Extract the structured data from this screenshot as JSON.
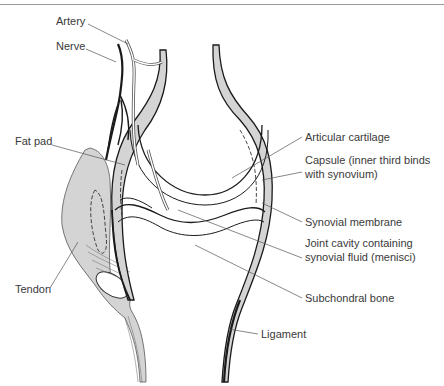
{
  "diagram": {
    "type": "anatomical-illustration",
    "colors": {
      "outline": "#1a1a1a",
      "fill_gray": "#d4d4d4",
      "leader": "#555555",
      "text": "#3a3a3a"
    },
    "labels": {
      "artery": "Artery",
      "nerve": "Nerve",
      "fat_pad": "Fat pad",
      "tendon": "Tendon",
      "articular_cartilage": "Articular cartilage",
      "capsule_line1": "Capsule (inner third binds",
      "capsule_line2": "with synovium)",
      "synovial_membrane": "Synovial membrane",
      "joint_cavity_line1": "Joint cavity containing",
      "joint_cavity_line2": "synovial fluid (menisci)",
      "subchondral_bone": "Subchondral bone",
      "ligament": "Ligament"
    }
  }
}
